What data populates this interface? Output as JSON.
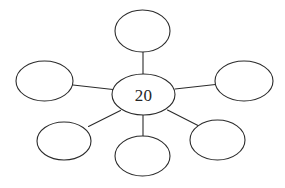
{
  "diagram": {
    "type": "bubble-map",
    "title": "",
    "background_color": "#ffffff",
    "stroke_color": "#2b2b2b",
    "fill_color": "#ffffff",
    "text_color": "#262626",
    "center": {
      "id": "center-node",
      "label": "20",
      "cx": 143.5,
      "cy": 94.5,
      "rx": 31.5,
      "ry": 20.5
    },
    "branches": [
      {
        "id": "branch-node-top",
        "position": "top",
        "label": "",
        "cx": 142.5,
        "cy": 31.0,
        "rx": 27.5,
        "ry": 21.0,
        "connector": {
          "x1": 143.0,
          "y1": 52.0,
          "x2": 143.0,
          "y2": 74.0
        }
      },
      {
        "id": "branch-node-left",
        "position": "left",
        "label": "",
        "cx": 44.5,
        "cy": 81.0,
        "rx": 28.5,
        "ry": 20.0,
        "connector": {
          "x1": 73.0,
          "y1": 85.0,
          "x2": 113.0,
          "y2": 89.5
        }
      },
      {
        "id": "branch-node-right",
        "position": "right",
        "label": "",
        "cx": 244.0,
        "cy": 81.0,
        "rx": 29.0,
        "ry": 20.0,
        "connector": {
          "x1": 175.0,
          "y1": 89.0,
          "x2": 215.5,
          "y2": 84.5
        }
      },
      {
        "id": "branch-node-bottom-left",
        "position": "bottom-left",
        "label": "",
        "cx": 64.0,
        "cy": 141.0,
        "rx": 27.0,
        "ry": 19.0,
        "connector": {
          "x1": 88.5,
          "y1": 126.5,
          "x2": 120.5,
          "y2": 110.5
        }
      },
      {
        "id": "branch-node-bottom-center",
        "position": "bottom-center",
        "label": "",
        "cx": 142.5,
        "cy": 156.0,
        "rx": 27.5,
        "ry": 20.0,
        "connector": {
          "x1": 143.0,
          "y1": 115.0,
          "x2": 143.0,
          "y2": 136.5
        }
      },
      {
        "id": "branch-node-bottom-right",
        "position": "bottom-right",
        "label": "",
        "cx": 217.5,
        "cy": 140.0,
        "rx": 27.5,
        "ry": 20.0,
        "connector": {
          "x1": 167.5,
          "y1": 110.0,
          "x2": 198.0,
          "y2": 125.5
        }
      }
    ]
  }
}
